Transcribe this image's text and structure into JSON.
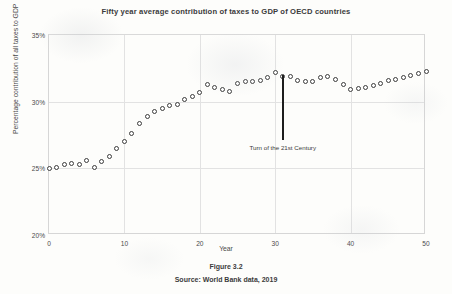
{
  "chart_data": {
    "type": "scatter",
    "title": "Fifty year average contribution of taxes to GDP of OECD countries",
    "xlabel": "Year",
    "ylabel": "Percentage contribution of all taxes to GDP",
    "xlim": [
      0,
      50
    ],
    "ylim": [
      20,
      35
    ],
    "xticks": [
      "0",
      "10",
      "20",
      "30",
      "40",
      "50"
    ],
    "xtick_values": [
      0,
      10,
      20,
      30,
      40,
      50
    ],
    "yticks": [
      "20%",
      "25%",
      "30%",
      "35%"
    ],
    "ytick_values": [
      20,
      25,
      30,
      35
    ],
    "grid": true,
    "legend": null,
    "marker": "open-circle",
    "marker_color": "#3c3c3c",
    "x": [
      0,
      1,
      2,
      3,
      4,
      5,
      6,
      7,
      8,
      9,
      10,
      11,
      12,
      13,
      14,
      15,
      16,
      17,
      18,
      19,
      20,
      21,
      22,
      23,
      24,
      25,
      26,
      27,
      28,
      29,
      30,
      31,
      32,
      33,
      34,
      35,
      36,
      37,
      38,
      39,
      40,
      41,
      42,
      43,
      44,
      45,
      46,
      47,
      48,
      49,
      50
    ],
    "values": [
      25.0,
      25.1,
      25.3,
      25.4,
      25.3,
      25.6,
      25.1,
      25.5,
      25.9,
      26.5,
      27.0,
      27.6,
      28.4,
      28.9,
      29.3,
      29.5,
      29.7,
      29.8,
      30.2,
      30.4,
      30.7,
      31.3,
      31.1,
      30.9,
      30.8,
      31.4,
      31.5,
      31.5,
      31.6,
      31.8,
      32.2,
      31.9,
      31.9,
      31.6,
      31.5,
      31.5,
      31.8,
      31.9,
      31.7,
      31.3,
      30.9,
      31.0,
      31.1,
      31.2,
      31.4,
      31.6,
      31.7,
      31.8,
      32.0,
      32.1,
      32.3
    ],
    "annotations": [
      {
        "text": "Turn of the 21st Century",
        "x": 31,
        "line_top_value": 32.0,
        "line_bottom_value": 27.1
      }
    ]
  },
  "caption": {
    "figure_label": "Figure 3.2",
    "source": "Source: World Bank data, 2019"
  }
}
